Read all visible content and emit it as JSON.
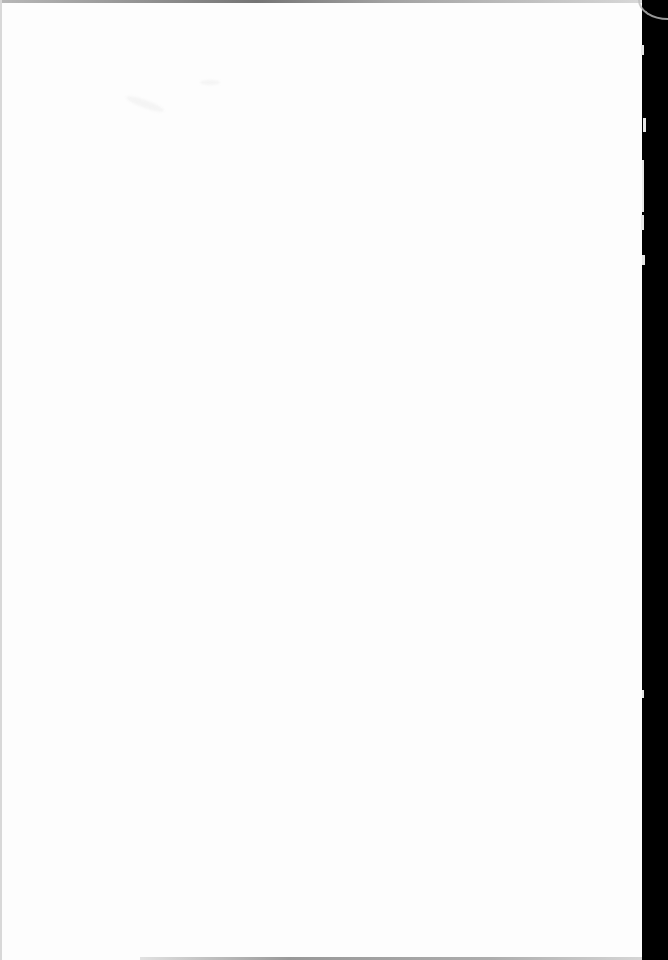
{
  "document": {
    "type": "scanned-page",
    "page_blank": true,
    "text_content": "",
    "colors": {
      "paper": "#fdfdfd",
      "binding": "#000000"
    }
  }
}
